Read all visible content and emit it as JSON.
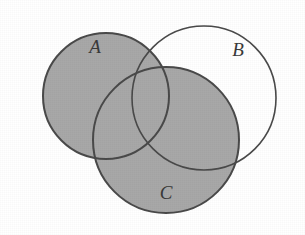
{
  "figure": {
    "type": "venn-diagram",
    "set_count": 3,
    "background_color": "#ffffff",
    "frame_color": "#2b2b2b",
    "stroke_color": "#4a4a4a",
    "shade_color": "#a8a8a8",
    "shaded_description": "A union C",
    "unshaded_description": "B only (the part of B outside A and C)"
  },
  "sets": [
    {
      "id": "A",
      "label": "A",
      "label_x": 95,
      "label_y": 53,
      "cx": 106,
      "cy": 96,
      "r": 63,
      "shaded": true
    },
    {
      "id": "B",
      "label": "B",
      "label_x": 238,
      "label_y": 56,
      "cx": 204,
      "cy": 98,
      "r": 72,
      "shaded": false
    },
    {
      "id": "C",
      "label": "C",
      "label_x": 166,
      "label_y": 199,
      "cx": 166,
      "cy": 140,
      "r": 73,
      "shaded": true
    }
  ],
  "regions": [
    {
      "id": "A-only",
      "expression": "A \\ (B u C)",
      "shaded": true
    },
    {
      "id": "B-only",
      "expression": "B \\ (A u C)",
      "shaded": false
    },
    {
      "id": "C-only",
      "expression": "C \\ (A u B)",
      "shaded": true
    },
    {
      "id": "A-and-B",
      "expression": "A n B \\ C",
      "shaded": true
    },
    {
      "id": "A-and-C",
      "expression": "A n C \\ B",
      "shaded": true
    },
    {
      "id": "B-and-C",
      "expression": "B n C \\ A",
      "shaded": true
    },
    {
      "id": "A-B-C",
      "expression": "A n B n C",
      "shaded": true
    }
  ]
}
